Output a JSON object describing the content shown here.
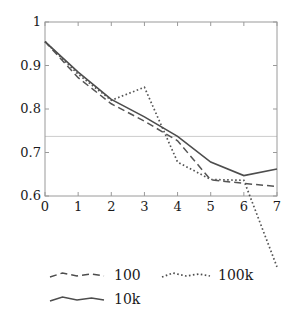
{
  "chart_data": {
    "type": "line",
    "title": "",
    "subtitle": "",
    "xlabel": "",
    "ylabel": "",
    "x": [
      0,
      1,
      2,
      3,
      4,
      5,
      6,
      7
    ],
    "xlim": [
      0,
      7
    ],
    "ylim": [
      0.6,
      1.0
    ],
    "xticks": [
      "0",
      "1",
      "2",
      "3",
      "4",
      "5",
      "6",
      "7"
    ],
    "yticks": [
      "0.6",
      "0.7",
      "0.8",
      "0.9",
      "1"
    ],
    "ytick_values": [
      0.6,
      0.7,
      0.8,
      0.9,
      1.0
    ],
    "grid": false,
    "reference_line": {
      "orientation": "horizontal",
      "value": 0.737,
      "color": "#cccccc"
    },
    "legend_position": "below-plot",
    "series": [
      {
        "name": "100",
        "style": "dashed",
        "color": "#555555",
        "values": [
          0.955,
          0.872,
          0.812,
          0.772,
          0.727,
          0.637,
          0.629,
          0.622
        ]
      },
      {
        "name": "100k",
        "style": "dotted",
        "color": "#555555",
        "values": [
          0.955,
          0.88,
          0.82,
          0.85,
          0.678,
          0.638,
          0.636,
          0.437
        ],
        "note": "final segment falls below plotted y-range and is clipped outside the axes"
      },
      {
        "name": "10k",
        "style": "solid",
        "color": "#4d4d4d",
        "values": [
          0.955,
          0.885,
          0.822,
          0.782,
          0.737,
          0.678,
          0.647,
          0.662
        ]
      }
    ]
  },
  "axes": {
    "frame_color": "#999999",
    "y_tick_labels": [
      {
        "text": "1",
        "value": 1.0
      },
      {
        "text": "0.9",
        "value": 0.9
      },
      {
        "text": "0.8",
        "value": 0.8
      },
      {
        "text": "0.7",
        "value": 0.7
      },
      {
        "text": "0.6",
        "value": 0.6
      }
    ],
    "x_tick_labels": [
      {
        "text": "0",
        "value": 0
      },
      {
        "text": "1",
        "value": 1
      },
      {
        "text": "2",
        "value": 2
      },
      {
        "text": "3",
        "value": 3
      },
      {
        "text": "4",
        "value": 4
      },
      {
        "text": "5",
        "value": 5
      },
      {
        "text": "6",
        "value": 6
      },
      {
        "text": "7",
        "value": 7
      }
    ]
  },
  "legend": {
    "entries": [
      {
        "label": "100",
        "style": "dashed"
      },
      {
        "label": "100k",
        "style": "dotted"
      },
      {
        "label": "10k",
        "style": "solid"
      }
    ]
  }
}
